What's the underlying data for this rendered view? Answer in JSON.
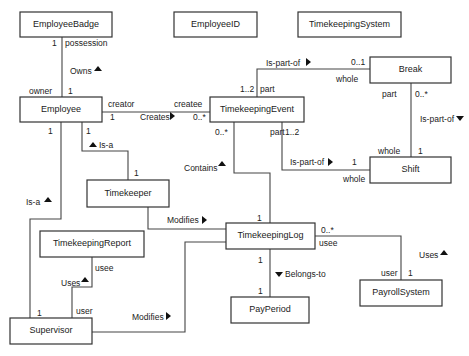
{
  "diagram": {
    "type": "UML class diagram",
    "classes": {
      "employee_badge": "EmployeeBadge",
      "employee_id": "EmployeeID",
      "timekeeping_system": "TimekeepingSystem",
      "employee": "Employee",
      "timekeeping_event": "TimekeepingEvent",
      "break": "Break",
      "shift": "Shift",
      "timekeeper": "Timekeeper",
      "timekeeping_log": "TimekeepingLog",
      "timekeeping_report": "TimekeepingReport",
      "supervisor": "Supervisor",
      "pay_period": "PayPeriod",
      "payroll_system": "PayrollSystem"
    },
    "associations": {
      "owns": {
        "name": "Owns",
        "direction": "up",
        "badge_mult": "1",
        "badge_role": "possession",
        "employee_mult": "1",
        "employee_role": "owner"
      },
      "creates": {
        "name": "Creates",
        "direction": "right",
        "creator_role": "creator",
        "creator_mult": "1",
        "createe_role": "createe",
        "createe_mult": "0..*"
      },
      "event_break": {
        "name": "Is-part-of",
        "direction": "right",
        "event_mult": "1..2",
        "event_role": "part",
        "break_mult": "0..1",
        "break_role": "whole"
      },
      "break_shift": {
        "name": "Is-part-of",
        "direction": "down",
        "break_role": "part",
        "break_mult": "0..*",
        "shift_role": "whole",
        "shift_mult": "1"
      },
      "event_shift": {
        "name": "Is-part-of",
        "direction": "right",
        "event_role": "part",
        "event_mult": "1..2",
        "shift_mult": "1",
        "shift_role": "whole"
      },
      "contains": {
        "name": "Contains",
        "direction": "up",
        "event_mult": "0..*",
        "log_mult": "1"
      },
      "employee_timekeeper_isa": {
        "name": "Is-a",
        "direction": "up",
        "employee_mult": "1",
        "timekeeper_mult": "1"
      },
      "employee_supervisor_isa": {
        "name": "Is-a",
        "direction": "up",
        "employee_mult": "1",
        "supervisor_mult": "1"
      },
      "timekeeper_modifies": {
        "name": "Modifies",
        "direction": "right"
      },
      "supervisor_modifies": {
        "name": "Modifies",
        "direction": "right"
      },
      "supervisor_uses": {
        "name": "Uses",
        "direction": "up",
        "report_role": "usee",
        "supervisor_role": "user"
      },
      "belongs_to": {
        "name": "Belongs-to",
        "direction": "down",
        "log_mult": "1",
        "period_mult": "1"
      },
      "payroll_uses": {
        "name": "Uses",
        "direction": "up",
        "log_mult": "0..*",
        "log_role": "usee",
        "payroll_role": "user",
        "payroll_mult": "1"
      }
    }
  }
}
